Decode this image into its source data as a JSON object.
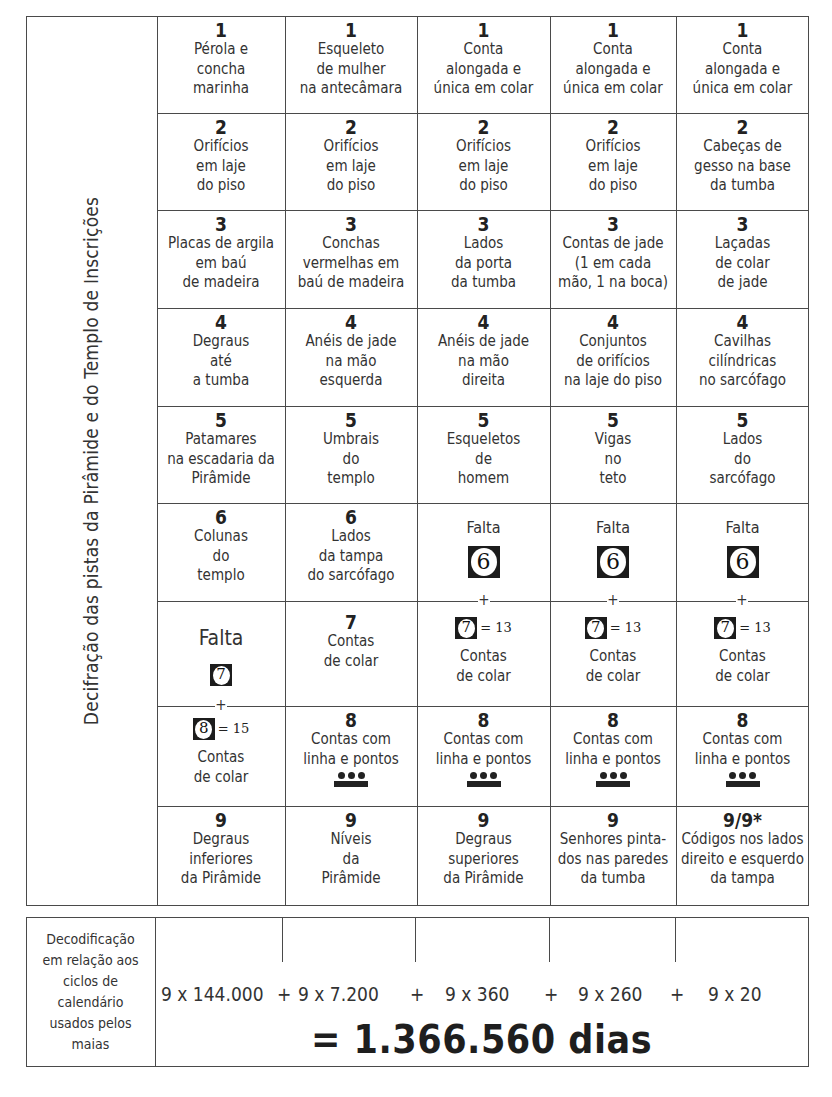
{
  "side_label": "Decifração das pistas da Pirâmide e do Templo de Inscrições",
  "grid": {
    "rows": [
      {
        "number": "1",
        "cells": [
          {
            "num": "1",
            "desc": "Pérola e\nconcha\nmarinha"
          },
          {
            "num": "1",
            "desc": "Esqueleto\nde mulher\nna antecâmara"
          },
          {
            "num": "1",
            "desc": "Conta\nalongada e\núnica em colar"
          },
          {
            "num": "1",
            "desc": "Conta\nalongada e\núnica em colar"
          },
          {
            "num": "1",
            "desc": "Conta\nalongada e\núnica em colar"
          }
        ]
      },
      {
        "number": "2",
        "cells": [
          {
            "num": "2",
            "desc": "Orifícios\nem laje\ndo piso"
          },
          {
            "num": "2",
            "desc": "Orifícios\nem laje\ndo piso"
          },
          {
            "num": "2",
            "desc": "Orifícios\nem laje\ndo piso"
          },
          {
            "num": "2",
            "desc": "Orifícios\nem laje\ndo piso"
          },
          {
            "num": "2",
            "desc": "Cabeças de\ngesso na base\nda tumba"
          }
        ]
      },
      {
        "number": "3",
        "cells": [
          {
            "num": "3",
            "desc": "Placas de argila\nem baú\nde madeira"
          },
          {
            "num": "3",
            "desc": "Conchas\nvermelhas em\nbaú de madeira"
          },
          {
            "num": "3",
            "desc": "Lados\nda porta\nda tumba"
          },
          {
            "num": "3",
            "desc": "Contas de jade\n(1 em cada\nmão, 1 na boca)"
          },
          {
            "num": "3",
            "desc": "Laçadas\nde colar\nde jade"
          }
        ]
      },
      {
        "number": "4",
        "cells": [
          {
            "num": "4",
            "desc": "Degraus\naté\na tumba"
          },
          {
            "num": "4",
            "desc": "Anéis de jade\nna mão\nesquerda"
          },
          {
            "num": "4",
            "desc": "Anéis de jade\nna mão\ndireita"
          },
          {
            "num": "4",
            "desc": "Conjuntos\nde orifícios\nna laje do piso"
          },
          {
            "num": "4",
            "desc": "Cavilhas\ncilíndricas\nno sarcófago"
          }
        ]
      },
      {
        "number": "5",
        "cells": [
          {
            "num": "5",
            "desc": "Patamares\nna escadaria da\nPirâmide"
          },
          {
            "num": "5",
            "desc": "Umbrais\ndo\ntemplo"
          },
          {
            "num": "5",
            "desc": "Esqueletos\nde\nhomem"
          },
          {
            "num": "5",
            "desc": "Vigas\nno\nteto"
          },
          {
            "num": "5",
            "desc": "Lados\ndo\nsarcófago"
          }
        ]
      },
      {
        "number": "6",
        "cells": [
          {
            "num": "6",
            "desc": "Colunas\ndo\ntemplo"
          },
          {
            "num": "6",
            "desc": "Lados\nda tampa\ndo sarcófago"
          },
          {
            "missing_label": "Falta",
            "glyph": "6"
          },
          {
            "missing_label": "Falta",
            "glyph": "6"
          },
          {
            "missing_label": "Falta",
            "glyph": "6"
          }
        ]
      },
      {
        "number": "7",
        "cells": [
          {
            "missing_label": "Falta",
            "glyph": "7"
          },
          {
            "num": "7",
            "desc": "Contas\nde colar"
          },
          {
            "glyph": "7",
            "equals": "= 13",
            "desc": "Contas\nde colar"
          },
          {
            "glyph": "7",
            "equals": "= 13",
            "desc": "Contas\nde colar"
          },
          {
            "glyph": "7",
            "equals": "= 13",
            "desc": "Contas\nde colar"
          }
        ]
      },
      {
        "number": "8",
        "cells": [
          {
            "glyph": "8",
            "equals": "= 15",
            "desc": "Contas\nde colar"
          },
          {
            "num": "8",
            "desc": "Contas com\nlinha e pontos",
            "symbol": "maya-numeral-8"
          },
          {
            "num": "8",
            "desc": "Contas com\nlinha e pontos",
            "symbol": "maya-numeral-8"
          },
          {
            "num": "8",
            "desc": "Contas com\nlinha e pontos",
            "symbol": "maya-numeral-8"
          },
          {
            "num": "8",
            "desc": "Contas com\nlinha e pontos",
            "symbol": "maya-numeral-8"
          }
        ]
      },
      {
        "number": "9",
        "cells": [
          {
            "num": "9",
            "desc": "Degraus\ninferiores\nda Pirâmide"
          },
          {
            "num": "9",
            "desc": "Níveis\nda\nPirâmide"
          },
          {
            "num": "9",
            "desc": "Degraus\nsuperiores\nda Pirâmide"
          },
          {
            "num": "9",
            "desc": "Senhores pinta-\ndos nas paredes\nda tumba"
          },
          {
            "num": "9/9*",
            "desc": "Códigos nos lados\ndireito e esquerdo\nda tampa"
          }
        ]
      }
    ],
    "plus_sign": "+"
  },
  "decoding": {
    "label": "Decodificação\nem relação aos\nciclos de\ncalendário\nusados pelos\nmaias",
    "terms": [
      "9 x 144.000",
      "9 x 7.200",
      "9 x 360",
      "9 x 260",
      "9 x 20"
    ],
    "operators": [
      "+",
      "+",
      "+",
      "+"
    ],
    "total": "= 1.366.560 dias"
  }
}
